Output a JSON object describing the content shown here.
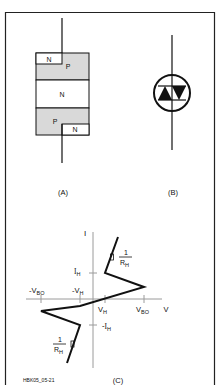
{
  "figure_id": "HBK05_05-21",
  "panels": {
    "a": {
      "caption": "(A)",
      "layers": [
        {
          "label": "N",
          "region": "top-left-contact"
        },
        {
          "label": "P",
          "region": "top-layer"
        },
        {
          "label": "N",
          "region": "middle-layer"
        },
        {
          "label": "P",
          "region": "bottom-layer"
        },
        {
          "label": "N",
          "region": "bottom-right-contact"
        }
      ]
    },
    "b": {
      "caption": "(B)",
      "symbol": "bidirectional-thyristor-diac-icon"
    },
    "c": {
      "caption": "(C)",
      "labels": {
        "y_axis": "I",
        "x_axis": "V",
        "ih_pos": "I",
        "ih_pos_sub": "H",
        "ih_neg": "-I",
        "ih_neg_sub": "H",
        "vh_pos": "V",
        "vh_pos_sub": "H",
        "vh_neg": "-V",
        "vh_neg_sub": "H",
        "vbo_pos": "V",
        "vbo_pos_sub": "BO",
        "vbo_neg": "-V",
        "vbo_neg_sub": "BO",
        "slope_num_top": "1",
        "slope_den_top": "R",
        "slope_den_top_sub": "H",
        "slope_num_bot": "1",
        "slope_den_bot": "R",
        "slope_den_bot_sub": "H"
      }
    }
  },
  "colors": {
    "stroke": "#111111",
    "p_fill": "#d9d9d9",
    "n_fill": "#ffffff",
    "axis": "#9a9a9a"
  }
}
